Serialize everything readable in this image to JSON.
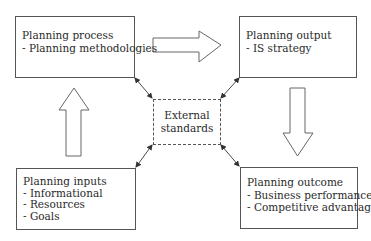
{
  "diagram": {
    "nodes": {
      "process": {
        "title": "Planning process",
        "items": [
          "- Planning methodologies"
        ]
      },
      "output": {
        "title": "Planning output",
        "items": [
          "- IS strategy"
        ]
      },
      "inputs": {
        "title": "Planning inputs",
        "items": [
          "- Informational",
          "- Resources",
          "- Goals"
        ]
      },
      "outcome": {
        "title": "Planning outcome",
        "items": [
          "- Business performance",
          "- Competitive advantage"
        ]
      },
      "standards": {
        "lines": [
          "External",
          "standards"
        ]
      }
    },
    "flow_arrows": [
      {
        "from": "process",
        "to": "output",
        "direction": "right"
      },
      {
        "from": "output",
        "to": "outcome",
        "direction": "down"
      },
      {
        "from": "inputs",
        "to": "process",
        "direction": "up"
      }
    ],
    "connectors": [
      {
        "from": "standards",
        "to": "process",
        "type": "bidirectional"
      },
      {
        "from": "standards",
        "to": "output",
        "type": "bidirectional"
      },
      {
        "from": "standards",
        "to": "inputs",
        "type": "bidirectional"
      },
      {
        "from": "standards",
        "to": "outcome",
        "type": "bidirectional"
      }
    ],
    "colors": {
      "stroke": "#555555",
      "background": "#ffffff",
      "text": "#2a2a2a"
    }
  }
}
